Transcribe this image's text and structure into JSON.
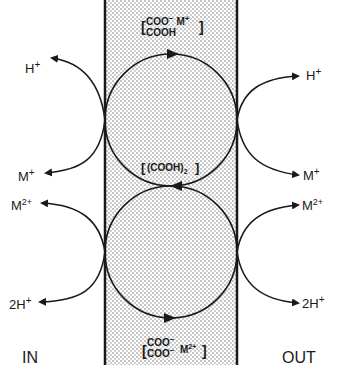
{
  "diagram": {
    "type": "membrane-carrier-transport",
    "sides": {
      "left": "IN",
      "right": "OUT"
    },
    "carrier_states": {
      "top": {
        "line1": "COO",
        "line1_sup": "−",
        "line1_ion": "M",
        "line1_ion_sup": "+",
        "line2": "COOH"
      },
      "middle": {
        "text": "(COOH)",
        "sub": "2"
      },
      "bottom": {
        "line1": "COO",
        "line1_sup": "−",
        "line2": "COO",
        "line2_sup": "−",
        "ion": "M",
        "ion_sup": "2+"
      }
    },
    "left_upper": {
      "top_ion": "H",
      "top_sup": "+",
      "bottom_ion": "M",
      "bottom_sup": "+"
    },
    "left_lower": {
      "top_ion": "M",
      "top_sup": "2+",
      "bottom_ion": "2H",
      "bottom_sup": "+"
    },
    "right_upper": {
      "top_ion": "H",
      "top_sup": "+",
      "bottom_ion": "M",
      "bottom_sup": "+"
    },
    "right_lower": {
      "top_ion": "M",
      "top_sup": "2+",
      "bottom_ion": "2H",
      "bottom_sup": "+"
    },
    "colors": {
      "ink": "#1a1a1a",
      "membrane_dots": "#6b6b6b",
      "background": "#ffffff"
    }
  }
}
